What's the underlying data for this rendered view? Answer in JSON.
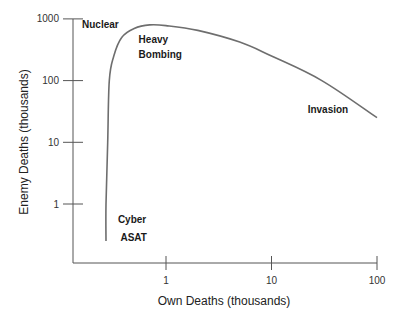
{
  "chart_data": {
    "type": "line",
    "title": "",
    "xlabel": "Own Deaths (thousands)",
    "ylabel": "Enemy Deaths (thousands)",
    "xscale": "log",
    "yscale": "log",
    "x_ticks": [
      1,
      10,
      100
    ],
    "x_tick_labels": [
      "1",
      "10",
      "100"
    ],
    "y_ticks": [
      1,
      10,
      100,
      1000
    ],
    "y_tick_labels": [
      "1",
      "10",
      "100",
      "1000"
    ],
    "xlim": [
      0.12,
      100
    ],
    "ylim": [
      0.1,
      1000
    ],
    "grid": false,
    "legend": "none",
    "series": [
      {
        "name": "Enemy vs Own Deaths",
        "x": [
          0.27,
          0.27,
          0.28,
          0.29,
          0.32,
          0.38,
          0.5,
          0.7,
          1.0,
          2.0,
          5.0,
          10,
          30,
          100
        ],
        "y": [
          0.25,
          1,
          10,
          100,
          250,
          500,
          700,
          800,
          780,
          650,
          420,
          250,
          100,
          25
        ]
      }
    ],
    "annotations": [
      {
        "text": "Nuclear",
        "x": 0.16,
        "y": 700
      },
      {
        "text": "Heavy",
        "x": 0.55,
        "y": 400
      },
      {
        "text": "Bombing",
        "x": 0.55,
        "y": 230
      },
      {
        "text": "Invasion",
        "x": 22,
        "y": 30
      },
      {
        "text": "Cyber",
        "x": 0.35,
        "y": 0.5
      },
      {
        "text": "ASAT",
        "x": 0.37,
        "y": 0.25
      }
    ]
  }
}
